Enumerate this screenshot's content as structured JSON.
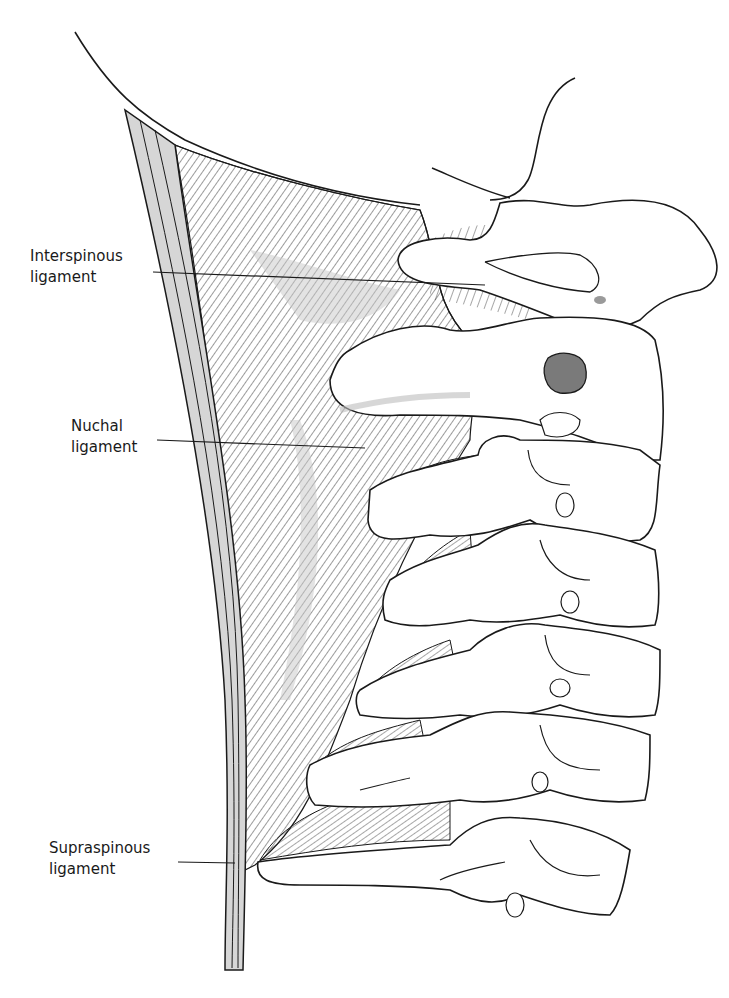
{
  "labels": [
    {
      "id": "interspinous",
      "line1": "Interspinous",
      "line2": "ligament"
    },
    {
      "id": "nuchal",
      "line1": "Nuchal",
      "line2": "ligament"
    },
    {
      "id": "supraspinous",
      "line1": "Supraspinous",
      "line2": "ligament"
    }
  ],
  "colors": {
    "ink": "#1a1a1a",
    "shade": "#c8c8c8",
    "dark_shade": "#7a7a7a",
    "background": "#ffffff"
  }
}
